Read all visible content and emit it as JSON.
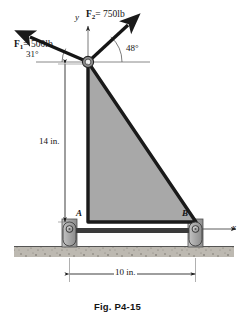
{
  "figure": {
    "caption": "Fig. P4-15",
    "background_color": "#ffffff",
    "body_fill_color": "#a8a8a8",
    "outline_color": "#1a1a1a",
    "ground_color": "#b4b0a8"
  },
  "axes": {
    "y_label": "y",
    "x_label": "x"
  },
  "forces": [
    {
      "name": "F1",
      "symbol": "F",
      "subscript": "1",
      "equals": "=",
      "magnitude": "500",
      "unit": "lb",
      "label": "F1 = 500 lb",
      "angle_label": "31°",
      "angle_value": 31,
      "direction": "up-left"
    },
    {
      "name": "F2",
      "symbol": "F",
      "subscript": "2",
      "equals": "=",
      "magnitude": "750",
      "unit": "lb",
      "label": "F2 = 750 lb",
      "angle_label": "48°",
      "angle_value": 48,
      "direction": "up-right"
    }
  ],
  "supports": [
    {
      "id": "A",
      "label": "A",
      "position": "bottom-left"
    },
    {
      "id": "B",
      "label": "B",
      "position": "bottom-right"
    }
  ],
  "dimensions": [
    {
      "id": "height",
      "label": "14 in.",
      "value": 14,
      "unit": "in.",
      "orientation": "vertical"
    },
    {
      "id": "span",
      "label": "10 in.",
      "value": 10,
      "unit": "in.",
      "orientation": "horizontal"
    }
  ]
}
